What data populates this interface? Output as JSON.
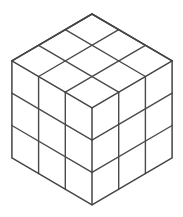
{
  "figure": {
    "name": "isometric-cube",
    "projection": "isometric",
    "divisions_per_edge": 3,
    "visible_faces": [
      "top",
      "left",
      "right"
    ],
    "cells_per_face": 9,
    "total_visible_cells": 27,
    "colors": {
      "background": "#ffffff",
      "face_fill": "#ffffff",
      "outline_stroke": "#444444",
      "grid_stroke": "#4a4a4a"
    },
    "stroke_widths": {
      "outline": 1.5,
      "grid": 1.4
    },
    "canvas": {
      "width": 183,
      "height": 217
    },
    "geometry": {
      "origin_top_apex": [
        92,
        14
      ],
      "u_right_step": [
        53.7,
        31.3
      ],
      "v_left_step": [
        -53.7,
        31.3
      ],
      "w_down_step": [
        0,
        47
      ],
      "vertices": {
        "top_apex": [
          92,
          14
        ],
        "left_corner": [
          11,
          61
        ],
        "right_corner": [
          172,
          61
        ],
        "front_top_vertex": [
          92,
          108
        ],
        "bottom_left": [
          11,
          162
        ],
        "bottom_right": [
          172,
          162
        ],
        "bottom_apex": [
          92,
          205
        ]
      }
    }
  }
}
